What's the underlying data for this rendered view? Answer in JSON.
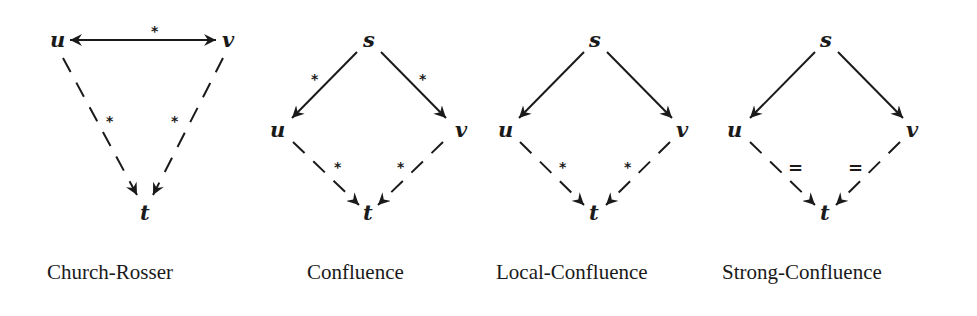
{
  "diagrams": [
    {
      "name": "church-rosser",
      "label": "Church-Rosser",
      "nodes": {
        "u": "u",
        "v": "v",
        "t": "t"
      },
      "edges": [
        {
          "from": "u",
          "to": "v",
          "style": "solid",
          "direction": "both",
          "annotation": "*"
        },
        {
          "from": "u",
          "to": "t",
          "style": "dashed",
          "annotation": "*"
        },
        {
          "from": "v",
          "to": "t",
          "style": "dashed",
          "annotation": "*"
        }
      ]
    },
    {
      "name": "confluence",
      "label": "Confluence",
      "nodes": {
        "s": "s",
        "u": "u",
        "v": "v",
        "t": "t"
      },
      "edges": [
        {
          "from": "s",
          "to": "u",
          "style": "solid",
          "annotation": "*"
        },
        {
          "from": "s",
          "to": "v",
          "style": "solid",
          "annotation": "*"
        },
        {
          "from": "u",
          "to": "t",
          "style": "dashed",
          "annotation": "*"
        },
        {
          "from": "v",
          "to": "t",
          "style": "dashed",
          "annotation": "*"
        }
      ]
    },
    {
      "name": "local-confluence",
      "label": "Local-Confluence",
      "nodes": {
        "s": "s",
        "u": "u",
        "v": "v",
        "t": "t"
      },
      "edges": [
        {
          "from": "s",
          "to": "u",
          "style": "solid",
          "annotation": ""
        },
        {
          "from": "s",
          "to": "v",
          "style": "solid",
          "annotation": ""
        },
        {
          "from": "u",
          "to": "t",
          "style": "dashed",
          "annotation": "*"
        },
        {
          "from": "v",
          "to": "t",
          "style": "dashed",
          "annotation": "*"
        }
      ]
    },
    {
      "name": "strong-confluence",
      "label": "Strong-Confluence",
      "nodes": {
        "s": "s",
        "u": "u",
        "v": "v",
        "t": "t"
      },
      "edges": [
        {
          "from": "s",
          "to": "u",
          "style": "solid",
          "annotation": ""
        },
        {
          "from": "s",
          "to": "v",
          "style": "solid",
          "annotation": ""
        },
        {
          "from": "u",
          "to": "t",
          "style": "dashed",
          "annotation": "="
        },
        {
          "from": "v",
          "to": "t",
          "style": "dashed",
          "annotation": "="
        }
      ]
    }
  ]
}
